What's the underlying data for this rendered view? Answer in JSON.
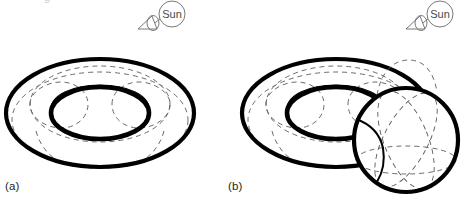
{
  "figure": {
    "background_color": "#ffffff",
    "ink_color": "#000000",
    "dashed_color": "#5a5a5a",
    "annotation_color": "#4a4a4a",
    "panels": [
      {
        "id": "a",
        "label": "(a)",
        "shapes": [
          "torus"
        ],
        "viewpoint": {
          "label": "Sun",
          "icon": "sun-viewpoint-cone-icon",
          "circle": {
            "cx": 172,
            "cy": 14,
            "r": 13
          },
          "cone": {
            "x": 138,
            "y": 14,
            "w": 18,
            "h": 14
          },
          "leader_line": {
            "x1": 157,
            "y1": 22,
            "x2": 161,
            "y2": 18
          }
        },
        "torus": {
          "center": [
            100,
            113
          ],
          "outer_rx": 94,
          "outer_ry": 54,
          "hole_rx": 49,
          "hole_ry": 26,
          "tube_color": "#ffffff",
          "silhouette_width": 4.2
        }
      },
      {
        "id": "b",
        "label": "(b)",
        "shapes": [
          "torus",
          "sphere"
        ],
        "viewpoint": {
          "label": "Sun",
          "icon": "sun-viewpoint-cone-icon",
          "circle": {
            "cx": 440,
            "cy": 14,
            "r": 13
          },
          "cone": {
            "x": 406,
            "y": 14,
            "w": 18,
            "h": 14
          },
          "leader_line": {
            "x1": 425,
            "y1": 22,
            "x2": 429,
            "y2": 18
          }
        },
        "torus": {
          "center": [
            336,
            113
          ],
          "outer_rx": 94,
          "outer_ry": 54,
          "hole_rx": 49,
          "hole_ry": 26,
          "tube_color": "#ffffff",
          "silhouette_width": 4.2
        },
        "sphere": {
          "center": [
            406,
            140
          ],
          "radius": 52,
          "fill": "#ffffff",
          "silhouette_width": 4.2,
          "meridians": 2,
          "latitudes": 1
        }
      }
    ],
    "clipped_text": {
      "top": "g",
      "bottom": ""
    }
  }
}
